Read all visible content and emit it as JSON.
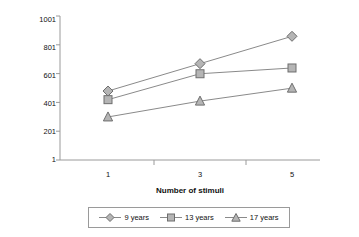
{
  "chart_data": {
    "type": "line",
    "title": "",
    "xlabel": "Number of stimuli",
    "ylabel": "Milliseconds",
    "categories": [
      "1",
      "3",
      "5"
    ],
    "x": [
      1,
      3,
      5
    ],
    "xtick_labels": [
      "1",
      "3",
      "5"
    ],
    "ytick_labels": [
      "1",
      "201",
      "401",
      "601",
      "801",
      "1001"
    ],
    "ytick_values": [
      1,
      201,
      401,
      601,
      801,
      1001
    ],
    "ylim": [
      1,
      1001
    ],
    "grid": false,
    "legend_position": "bottom",
    "series": [
      {
        "name": "9 years",
        "marker": "diamond",
        "color": "#7f7f7f",
        "values": [
          480,
          670,
          860
        ]
      },
      {
        "name": "13 years",
        "marker": "square",
        "color": "#7f7f7f",
        "values": [
          420,
          600,
          640
        ]
      },
      {
        "name": "17 years",
        "marker": "triangle",
        "color": "#7f7f7f",
        "values": [
          300,
          410,
          500
        ]
      }
    ]
  },
  "axes": {
    "y_label": "Milliseconds",
    "x_label": "Number of stimuli",
    "y_ticks": [
      {
        "label": "1001"
      },
      {
        "label": "801"
      },
      {
        "label": "601"
      },
      {
        "label": "401"
      },
      {
        "label": "201"
      },
      {
        "label": "1"
      }
    ],
    "x_ticks": [
      {
        "label": "1"
      },
      {
        "label": "3"
      },
      {
        "label": "5"
      }
    ]
  },
  "legend": {
    "entries": [
      {
        "label": "9 years",
        "marker": "diamond-marker"
      },
      {
        "label": "13 years",
        "marker": "square-marker"
      },
      {
        "label": "17 years",
        "marker": "triangle-marker"
      }
    ]
  },
  "colors": {
    "line": "#8a8a8a",
    "marker_fill": "#b5b5b5",
    "marker_stroke": "#6e6e6e",
    "axis": "#9a9a9a",
    "text": "#111111",
    "background": "#ffffff"
  }
}
